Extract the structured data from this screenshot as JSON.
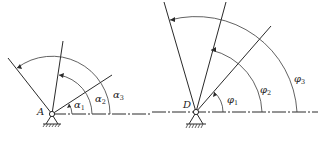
{
  "figure": {
    "left": {
      "pivot_label": "A",
      "angles": [
        {
          "symbol": "α",
          "subscript": "1"
        },
        {
          "symbol": "α",
          "subscript": "2"
        },
        {
          "symbol": "α",
          "subscript": "3"
        }
      ]
    },
    "right": {
      "pivot_label": "D",
      "angles": [
        {
          "symbol": "φ",
          "subscript": "1"
        },
        {
          "symbol": "φ",
          "subscript": "2"
        },
        {
          "symbol": "φ",
          "subscript": "3"
        }
      ]
    },
    "colors": {
      "stroke": "#2a2a2a",
      "background": "#ffffff"
    }
  }
}
